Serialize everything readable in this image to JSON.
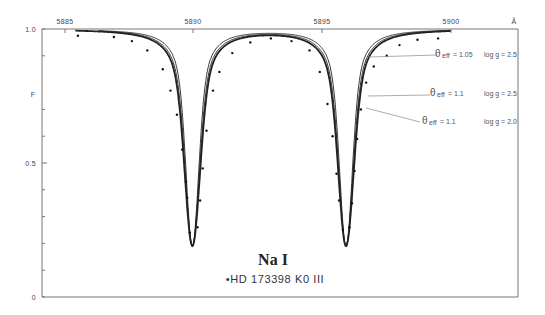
{
  "chart_data": {
    "type": "line",
    "title": "Na I",
    "subtitle": "•HD 173398 K0 III",
    "xlabel": "Å",
    "ylabel": "F",
    "xlim": [
      5884.1,
      5902.6
    ],
    "ylim": [
      0,
      1.0
    ],
    "x_ticks": [
      5885,
      5890,
      5895,
      5900
    ],
    "y_ticks": [
      {
        "value": 1.0,
        "label": "1.0"
      },
      {
        "value": 0.5,
        "label": "0.5"
      },
      {
        "value": 0,
        "label": "0"
      }
    ],
    "y_minor_ticks": [
      0.9,
      0.7,
      0.6,
      0.4,
      0.3,
      0.2,
      0.1
    ],
    "grid": false,
    "lines": [
      {
        "name": "D2",
        "center": 5889.95,
        "depth_model": 0.81,
        "depth_obs": 0.82
      },
      {
        "name": "D1",
        "center": 5895.92,
        "depth_model": 0.81,
        "depth_obs": 0.82
      }
    ],
    "series": [
      {
        "name": "θeff = 1.05, log g = 2.5",
        "style": "thin",
        "width_scale": 0.82,
        "annotation": {
          "theta": "θ",
          "theta_sub": "eff",
          "theta_val": "= 1.05",
          "logg": "log g = 2.5"
        }
      },
      {
        "name": "θeff = 1.1, log g = 2.5",
        "style": "thin",
        "width_scale": 0.92,
        "annotation": {
          "theta": "θ",
          "theta_sub": "eff",
          "theta_val": "= 1.1",
          "logg": "log g = 2.5"
        }
      },
      {
        "name": "θeff = 1.1, log g = 2.0",
        "style": "thick",
        "width_scale": 1.0,
        "annotation": {
          "theta": "θ",
          "theta_sub": "eff",
          "theta_val": "= 1.1",
          "logg": "log g = 2.0"
        }
      },
      {
        "name": "HD 173398 observed",
        "style": "points",
        "points": [
          [
            5885.5,
            0.975
          ],
          [
            5886.9,
            0.97
          ],
          [
            5887.6,
            0.955
          ],
          [
            5888.2,
            0.92
          ],
          [
            5888.8,
            0.85
          ],
          [
            5889.1,
            0.77
          ],
          [
            5889.35,
            0.68
          ],
          [
            5889.55,
            0.55
          ],
          [
            5889.7,
            0.43
          ],
          [
            5889.75,
            0.37
          ],
          [
            5889.85,
            0.24
          ],
          [
            5890.15,
            0.26
          ],
          [
            5890.25,
            0.36
          ],
          [
            5890.35,
            0.48
          ],
          [
            5890.5,
            0.62
          ],
          [
            5890.75,
            0.77
          ],
          [
            5891.0,
            0.84
          ],
          [
            5891.5,
            0.91
          ],
          [
            5892.2,
            0.95
          ],
          [
            5893.0,
            0.965
          ],
          [
            5893.8,
            0.955
          ],
          [
            5894.5,
            0.92
          ],
          [
            5894.9,
            0.84
          ],
          [
            5895.2,
            0.72
          ],
          [
            5895.4,
            0.6
          ],
          [
            5895.55,
            0.46
          ],
          [
            5895.65,
            0.36
          ],
          [
            5895.8,
            0.25
          ],
          [
            5896.05,
            0.26
          ],
          [
            5896.15,
            0.35
          ],
          [
            5896.25,
            0.47
          ],
          [
            5896.35,
            0.59
          ],
          [
            5896.5,
            0.7
          ],
          [
            5896.7,
            0.8
          ],
          [
            5897.0,
            0.86
          ],
          [
            5897.5,
            0.9
          ],
          [
            5898.0,
            0.94
          ],
          [
            5898.7,
            0.96
          ],
          [
            5899.5,
            0.965
          ]
        ]
      }
    ]
  },
  "labels": {
    "y_axis": "F",
    "x_unit": "Å",
    "title": "Na I",
    "subtitle": "•HD 173398 K0 III",
    "ann1_val": "= 1.05",
    "ann1_logg": "log g = 2.5",
    "ann2_val": "= 1.1",
    "ann2_logg": "log g = 2.5",
    "ann3_val": "= 1.1",
    "ann3_logg": "log g = 2.0",
    "theta": "θ",
    "eff": "eff",
    "tick_5885": "5885",
    "tick_5890": "5890",
    "tick_5895": "5895",
    "tick_5900": "5900",
    "y_1": "1.0",
    "y_05": "0.5",
    "y_0": "0"
  }
}
